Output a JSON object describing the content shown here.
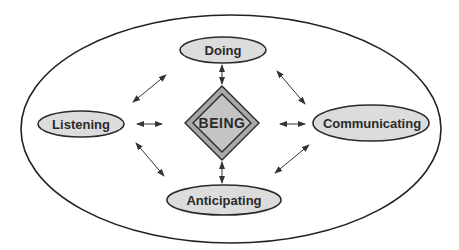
{
  "diagram": {
    "title": "",
    "center": {
      "label": "BEING",
      "shape": "diamond",
      "fill": "#b9b9b9",
      "inner_fill": "#c4c4c4"
    },
    "nodes": [
      {
        "id": "doing",
        "label": "Doing",
        "position": "top"
      },
      {
        "id": "listening",
        "label": "Listening",
        "position": "left"
      },
      {
        "id": "communicating",
        "label": "Communicating",
        "position": "right"
      },
      {
        "id": "anticipating",
        "label": "Anticipating",
        "position": "bottom"
      }
    ],
    "edges": [
      {
        "from": "being",
        "to": "doing",
        "type": "bidirectional-arrow"
      },
      {
        "from": "being",
        "to": "listening",
        "type": "bidirectional-arrow"
      },
      {
        "from": "being",
        "to": "communicating",
        "type": "bidirectional-arrow"
      },
      {
        "from": "being",
        "to": "anticipating",
        "type": "bidirectional-arrow"
      },
      {
        "from": "listening",
        "to": "doing",
        "type": "bidirectional-arrow"
      },
      {
        "from": "doing",
        "to": "communicating",
        "type": "bidirectional-arrow"
      },
      {
        "from": "listening",
        "to": "anticipating",
        "type": "bidirectional-arrow"
      },
      {
        "from": "anticipating",
        "to": "communicating",
        "type": "bidirectional-arrow"
      }
    ],
    "colors": {
      "node_fill": "#dcdcdc",
      "stroke": "#2a2a2a",
      "diamond_outer": "#a8a8a8",
      "diamond_inner": "#c2c2c2",
      "background": "#ffffff"
    }
  }
}
